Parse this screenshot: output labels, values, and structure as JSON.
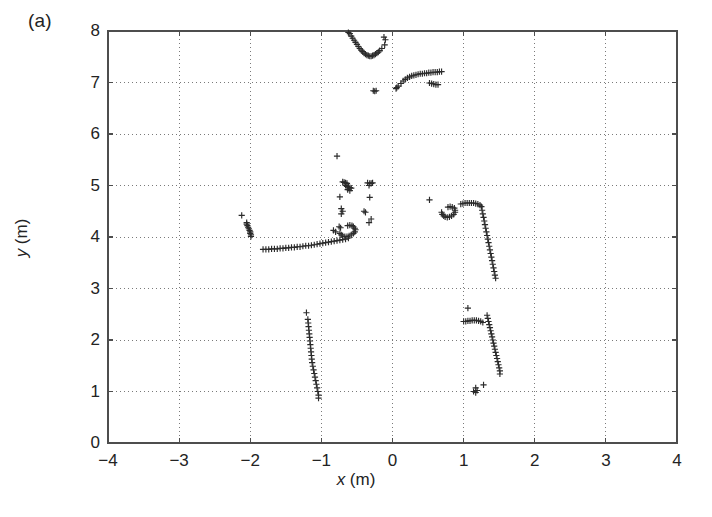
{
  "figure": {
    "panel_label": "(a)",
    "background_color": "#ffffff",
    "frame_color": "#4d4d4d",
    "grid_color": "#7a7a7a",
    "marker_color": "#2b2b2b",
    "marker_symbol": "+"
  },
  "chart_data": {
    "type": "scatter",
    "title": "",
    "xlabel": "x (m)",
    "ylabel": "y (m)",
    "xlim": [
      -4,
      4
    ],
    "ylim": [
      0,
      8
    ],
    "xticks": [
      -4,
      -3,
      -2,
      -1,
      0,
      1,
      2,
      3,
      4
    ],
    "yticks": [
      0,
      1,
      2,
      3,
      4,
      5,
      6,
      7,
      8
    ],
    "xticklabels": [
      "−4",
      "−3",
      "−2",
      "−1",
      "0",
      "1",
      "2",
      "3",
      "4"
    ],
    "yticklabels": [
      "0",
      "1",
      "2",
      "3",
      "4",
      "5",
      "6",
      "7",
      "8"
    ],
    "grid": true,
    "grid_style": "dotted",
    "legend": null,
    "marker": "+",
    "marker_color": "#2b2b2b",
    "series": [
      {
        "name": "laser-scan-points",
        "marker": "+",
        "points": [
          [
            -0.62,
            7.97
          ],
          [
            -0.6,
            7.95
          ],
          [
            -0.58,
            7.9
          ],
          [
            -0.56,
            7.86
          ],
          [
            -0.54,
            7.82
          ],
          [
            -0.52,
            7.78
          ],
          [
            -0.5,
            7.74
          ],
          [
            -0.48,
            7.7
          ],
          [
            -0.46,
            7.66
          ],
          [
            -0.44,
            7.63
          ],
          [
            -0.42,
            7.6
          ],
          [
            -0.4,
            7.57
          ],
          [
            -0.38,
            7.55
          ],
          [
            -0.36,
            7.53
          ],
          [
            -0.34,
            7.52
          ],
          [
            -0.32,
            7.51
          ],
          [
            -0.3,
            7.51
          ],
          [
            -0.28,
            7.52
          ],
          [
            -0.26,
            7.53
          ],
          [
            -0.24,
            7.55
          ],
          [
            -0.22,
            7.57
          ],
          [
            -0.2,
            7.59
          ],
          [
            -0.18,
            7.62
          ],
          [
            -0.12,
            7.88
          ],
          [
            -0.1,
            7.83
          ],
          [
            -0.11,
            7.73
          ],
          [
            -0.15,
            7.66
          ],
          [
            0.06,
            6.9
          ],
          [
            0.05,
            6.88
          ],
          [
            0.08,
            6.93
          ],
          [
            0.12,
            6.98
          ],
          [
            0.15,
            7.03
          ],
          [
            0.18,
            7.06
          ],
          [
            0.21,
            7.09
          ],
          [
            0.24,
            7.11
          ],
          [
            0.27,
            7.13
          ],
          [
            0.3,
            7.14
          ],
          [
            0.33,
            7.15
          ],
          [
            0.36,
            7.16
          ],
          [
            0.39,
            7.17
          ],
          [
            0.42,
            7.17
          ],
          [
            0.45,
            7.18
          ],
          [
            0.48,
            7.18
          ],
          [
            0.51,
            7.19
          ],
          [
            0.54,
            7.19
          ],
          [
            0.57,
            7.2
          ],
          [
            0.6,
            7.2
          ],
          [
            0.63,
            7.2
          ],
          [
            0.66,
            7.21
          ],
          [
            0.69,
            7.21
          ],
          [
            0.52,
            6.99
          ],
          [
            0.55,
            6.98
          ],
          [
            0.58,
            6.97
          ],
          [
            0.61,
            6.96
          ],
          [
            0.64,
            6.96
          ],
          [
            -0.27,
            6.84
          ],
          [
            -0.25,
            6.83
          ],
          [
            -0.23,
            6.84
          ],
          [
            -0.78,
            5.57
          ],
          [
            -0.7,
            5.07
          ],
          [
            -0.68,
            5.06
          ],
          [
            -0.66,
            5.05
          ],
          [
            -0.64,
            5.04
          ],
          [
            -0.66,
            5.0
          ],
          [
            -0.64,
            4.98
          ],
          [
            -0.62,
            4.97
          ],
          [
            -0.6,
            4.96
          ],
          [
            -0.58,
            4.95
          ],
          [
            -0.63,
            4.92
          ],
          [
            -0.6,
            4.9
          ],
          [
            -0.35,
            5.05
          ],
          [
            -0.32,
            5.04
          ],
          [
            -0.3,
            5.04
          ],
          [
            -0.28,
            5.05
          ],
          [
            -0.33,
            5.0
          ],
          [
            -0.74,
            4.78
          ],
          [
            -0.32,
            4.77
          ],
          [
            -0.72,
            4.55
          ],
          [
            -0.7,
            4.5
          ],
          [
            -0.72,
            4.45
          ],
          [
            -0.4,
            4.5
          ],
          [
            -0.38,
            4.48
          ],
          [
            -2.12,
            4.42
          ],
          [
            -2.05,
            4.28
          ],
          [
            -2.05,
            4.25
          ],
          [
            -2.04,
            4.22
          ],
          [
            -2.03,
            4.19
          ],
          [
            -2.02,
            4.16
          ],
          [
            -2.01,
            4.13
          ],
          [
            -2.0,
            4.1
          ],
          [
            -2.0,
            4.07
          ],
          [
            -1.99,
            4.04
          ],
          [
            -1.99,
            4.01
          ],
          [
            -0.3,
            4.35
          ],
          [
            -0.33,
            4.28
          ],
          [
            0.52,
            4.72
          ],
          [
            -0.83,
            4.13
          ],
          [
            -0.8,
            4.1
          ],
          [
            -0.75,
            4.2
          ],
          [
            -0.73,
            4.18
          ],
          [
            -0.63,
            4.22
          ],
          [
            -0.6,
            4.23
          ],
          [
            -0.57,
            4.22
          ],
          [
            -0.55,
            4.2
          ],
          [
            -0.53,
            4.17
          ],
          [
            -0.52,
            4.14
          ],
          [
            -0.53,
            4.1
          ],
          [
            -0.55,
            4.07
          ],
          [
            -0.58,
            4.04
          ],
          [
            -0.61,
            4.02
          ],
          [
            -0.64,
            4.01
          ],
          [
            -0.67,
            4.01
          ],
          [
            -0.7,
            4.02
          ],
          [
            -0.72,
            4.04
          ],
          [
            -0.74,
            4.07
          ],
          [
            0.78,
            4.58
          ],
          [
            0.81,
            4.59
          ],
          [
            0.84,
            4.58
          ],
          [
            0.87,
            4.56
          ],
          [
            0.88,
            4.52
          ],
          [
            0.88,
            4.48
          ],
          [
            0.86,
            4.44
          ],
          [
            0.83,
            4.41
          ],
          [
            0.8,
            4.39
          ],
          [
            0.77,
            4.38
          ],
          [
            0.74,
            4.39
          ],
          [
            0.72,
            4.41
          ],
          [
            0.7,
            4.44
          ],
          [
            0.69,
            4.48
          ],
          [
            0.96,
            4.64
          ],
          [
            0.99,
            4.65
          ],
          [
            1.02,
            4.66
          ],
          [
            1.05,
            4.66
          ],
          [
            1.08,
            4.66
          ],
          [
            1.11,
            4.66
          ],
          [
            1.14,
            4.66
          ],
          [
            1.17,
            4.65
          ],
          [
            1.2,
            4.64
          ],
          [
            1.23,
            4.62
          ],
          [
            1.25,
            4.59
          ],
          [
            1.26,
            4.52
          ],
          [
            1.27,
            4.45
          ],
          [
            1.28,
            4.38
          ],
          [
            1.29,
            4.31
          ],
          [
            1.3,
            4.24
          ],
          [
            1.31,
            4.17
          ],
          [
            1.32,
            4.1
          ],
          [
            1.33,
            4.03
          ],
          [
            1.34,
            3.96
          ],
          [
            1.35,
            3.89
          ],
          [
            1.36,
            3.82
          ],
          [
            1.37,
            3.75
          ],
          [
            1.38,
            3.68
          ],
          [
            1.39,
            3.61
          ],
          [
            1.4,
            3.54
          ],
          [
            1.41,
            3.47
          ],
          [
            1.42,
            3.4
          ],
          [
            1.43,
            3.33
          ],
          [
            1.44,
            3.26
          ],
          [
            1.45,
            3.2
          ],
          [
            -1.82,
            3.76
          ],
          [
            -1.78,
            3.76
          ],
          [
            -1.74,
            3.76
          ],
          [
            -1.7,
            3.77
          ],
          [
            -1.66,
            3.77
          ],
          [
            -1.62,
            3.77
          ],
          [
            -1.58,
            3.78
          ],
          [
            -1.54,
            3.78
          ],
          [
            -1.5,
            3.79
          ],
          [
            -1.46,
            3.79
          ],
          [
            -1.42,
            3.8
          ],
          [
            -1.38,
            3.8
          ],
          [
            -1.34,
            3.81
          ],
          [
            -1.3,
            3.81
          ],
          [
            -1.26,
            3.82
          ],
          [
            -1.22,
            3.83
          ],
          [
            -1.18,
            3.83
          ],
          [
            -1.14,
            3.84
          ],
          [
            -1.1,
            3.85
          ],
          [
            -1.06,
            3.86
          ],
          [
            -1.02,
            3.87
          ],
          [
            -0.98,
            3.88
          ],
          [
            -0.94,
            3.89
          ],
          [
            -0.9,
            3.9
          ],
          [
            -0.86,
            3.91
          ],
          [
            -0.82,
            3.92
          ],
          [
            -0.78,
            3.93
          ],
          [
            -0.74,
            3.94
          ],
          [
            -0.7,
            3.95
          ],
          [
            -0.66,
            3.96
          ],
          [
            -0.62,
            3.98
          ],
          [
            -1.21,
            2.53
          ],
          [
            -1.19,
            2.4
          ],
          [
            -1.185,
            2.33
          ],
          [
            -1.18,
            2.26
          ],
          [
            -1.175,
            2.19
          ],
          [
            -1.17,
            2.12
          ],
          [
            -1.165,
            2.05
          ],
          [
            -1.16,
            1.98
          ],
          [
            -1.155,
            1.91
          ],
          [
            -1.15,
            1.84
          ],
          [
            -1.145,
            1.77
          ],
          [
            -1.14,
            1.7
          ],
          [
            -1.135,
            1.63
          ],
          [
            -1.13,
            1.56
          ],
          [
            -1.12,
            1.49
          ],
          [
            -1.11,
            1.42
          ],
          [
            -1.1,
            1.35
          ],
          [
            -1.09,
            1.28
          ],
          [
            -1.08,
            1.21
          ],
          [
            -1.07,
            1.14
          ],
          [
            -1.06,
            1.07
          ],
          [
            -1.05,
            1.0
          ],
          [
            -1.04,
            0.93
          ],
          [
            -1.04,
            0.87
          ],
          [
            1.06,
            2.62
          ],
          [
            1.0,
            2.36
          ],
          [
            1.03,
            2.36
          ],
          [
            1.06,
            2.37
          ],
          [
            1.09,
            2.37
          ],
          [
            1.12,
            2.38
          ],
          [
            1.15,
            2.38
          ],
          [
            1.18,
            2.38
          ],
          [
            1.21,
            2.37
          ],
          [
            1.24,
            2.36
          ],
          [
            1.27,
            2.34
          ],
          [
            1.33,
            2.48
          ],
          [
            1.34,
            2.42
          ],
          [
            1.35,
            2.36
          ],
          [
            1.36,
            2.3
          ],
          [
            1.37,
            2.24
          ],
          [
            1.38,
            2.18
          ],
          [
            1.39,
            2.12
          ],
          [
            1.4,
            2.06
          ],
          [
            1.41,
            2.0
          ],
          [
            1.42,
            1.94
          ],
          [
            1.43,
            1.88
          ],
          [
            1.44,
            1.82
          ],
          [
            1.45,
            1.76
          ],
          [
            1.46,
            1.7
          ],
          [
            1.47,
            1.64
          ],
          [
            1.48,
            1.58
          ],
          [
            1.49,
            1.52
          ],
          [
            1.5,
            1.46
          ],
          [
            1.51,
            1.4
          ],
          [
            1.51,
            1.34
          ],
          [
            1.17,
            1.07
          ],
          [
            1.19,
            1.02
          ],
          [
            1.17,
            0.98
          ],
          [
            1.14,
            1.0
          ],
          [
            1.28,
            1.13
          ]
        ]
      }
    ]
  }
}
